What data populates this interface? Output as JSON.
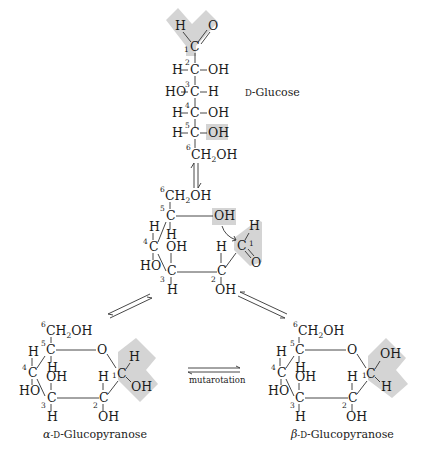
{
  "colors": {
    "highlight": "#d4d4d4",
    "ink": "#1a1a1a",
    "background": "#ffffff"
  },
  "open_chain": {
    "name": "D-Glucose",
    "name_prefix": "D",
    "name_suffix": "-Glucose",
    "c1": {
      "num": "1",
      "atom": "C",
      "h": "H",
      "o": "O"
    },
    "c2": {
      "num": "2",
      "left": "H",
      "atom": "C",
      "right": "OH"
    },
    "c3": {
      "num": "3",
      "left": "HO",
      "atom": "C",
      "right": "H"
    },
    "c4": {
      "num": "4",
      "left": "H",
      "atom": "C",
      "right": "OH"
    },
    "c5": {
      "num": "5",
      "left": "H",
      "atom": "C",
      "right": "OH"
    },
    "c6": {
      "num": "6",
      "group": "CH",
      "sub": "2",
      "tail": "OH"
    }
  },
  "intermediate": {
    "c6": {
      "num": "6",
      "group": "CH",
      "sub": "2",
      "tail": "OH"
    },
    "c5": {
      "num": "5",
      "atom": "C",
      "h": "H"
    },
    "o5": "OH",
    "c1": {
      "num": "1",
      "atom": "C",
      "h": "H",
      "o": "O"
    },
    "c4": {
      "num": "4",
      "atom": "C",
      "h": "H",
      "oh": "HO"
    },
    "c3": {
      "num": "3",
      "atom": "C",
      "oh": "OH",
      "h": "H"
    },
    "c2": {
      "num": "2",
      "atom": "C",
      "h": "H",
      "oh": "OH"
    }
  },
  "alpha": {
    "name_greek": "α",
    "name_prefix": "-D",
    "name_suffix": "-Glucopyranose",
    "c6": {
      "num": "6",
      "group": "CH",
      "sub": "2",
      "tail": "OH"
    },
    "c5": {
      "num": "5",
      "atom": "C",
      "h": "H"
    },
    "ring_o": "O",
    "c1": {
      "num": "1",
      "atom": "C",
      "up": "H",
      "down": "OH"
    },
    "c4": {
      "num": "4",
      "atom": "C",
      "h": "H",
      "oh": "HO"
    },
    "c3": {
      "num": "3",
      "atom": "C",
      "oh": "OH",
      "h": "H"
    },
    "c2": {
      "num": "2",
      "atom": "C",
      "h": "H",
      "oh": "OH"
    }
  },
  "beta": {
    "name_greek": "β",
    "name_prefix": "-D",
    "name_suffix": "-Glucopyranose",
    "c6": {
      "num": "6",
      "group": "CH",
      "sub": "2",
      "tail": "OH"
    },
    "c5": {
      "num": "5",
      "atom": "C",
      "h": "H"
    },
    "ring_o": "O",
    "c1": {
      "num": "1",
      "atom": "C",
      "up": "OH",
      "down": "H"
    },
    "c4": {
      "num": "4",
      "atom": "C",
      "h": "H",
      "oh": "HO"
    },
    "c3": {
      "num": "3",
      "atom": "C",
      "oh": "OH",
      "h": "H"
    },
    "c2": {
      "num": "2",
      "atom": "C",
      "h": "H",
      "oh": "OH"
    }
  },
  "arrows": {
    "mutarotation_label": "mutarotation"
  }
}
